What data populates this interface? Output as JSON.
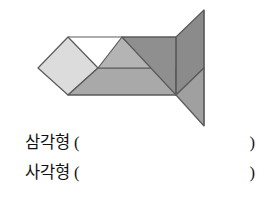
{
  "worksheet": {
    "figure": {
      "name": "tangram-fish",
      "description": "tangram fish figure composed of seven grey polygon pieces",
      "viewbox": "0 0 278 130",
      "stroke_color": "#4a4a4a",
      "pieces": [
        {
          "name": "left-square-piece",
          "points": "38,68 68,37 98,68 68,95",
          "fill": "#d9d9d9"
        },
        {
          "name": "small-triangle-upper-left",
          "points": "68,37 98,68 68,95",
          "fill": "#d0d0d0"
        },
        {
          "name": "parallelogram-lower-body",
          "points": "68,95 98,68 176,68 176,95",
          "fill": "#a8a8a8"
        },
        {
          "name": "medium-triangle-center",
          "points": "98,68 122,37 153,68",
          "fill": "#b3b3b3"
        },
        {
          "name": "large-triangle-body",
          "points": "122,37 176,37 176,95 122,95",
          "fill": "#9a9a9a"
        },
        {
          "name": "tail-triangle-upper",
          "points": "176,95 176,37 204,10 204,68",
          "fill": "#949494"
        },
        {
          "name": "tail-triangle-lower",
          "points": "176,95 204,68 204,126",
          "fill": "#a0a0a0"
        }
      ]
    },
    "answers": [
      {
        "name": "triangle-count-line",
        "label": "삼각형",
        "paren_open": "(",
        "paren_close": ")",
        "value": ""
      },
      {
        "name": "quadrilateral-count-line",
        "label": "사각형",
        "paren_open": "(",
        "paren_close": ")",
        "value": ""
      }
    ]
  }
}
